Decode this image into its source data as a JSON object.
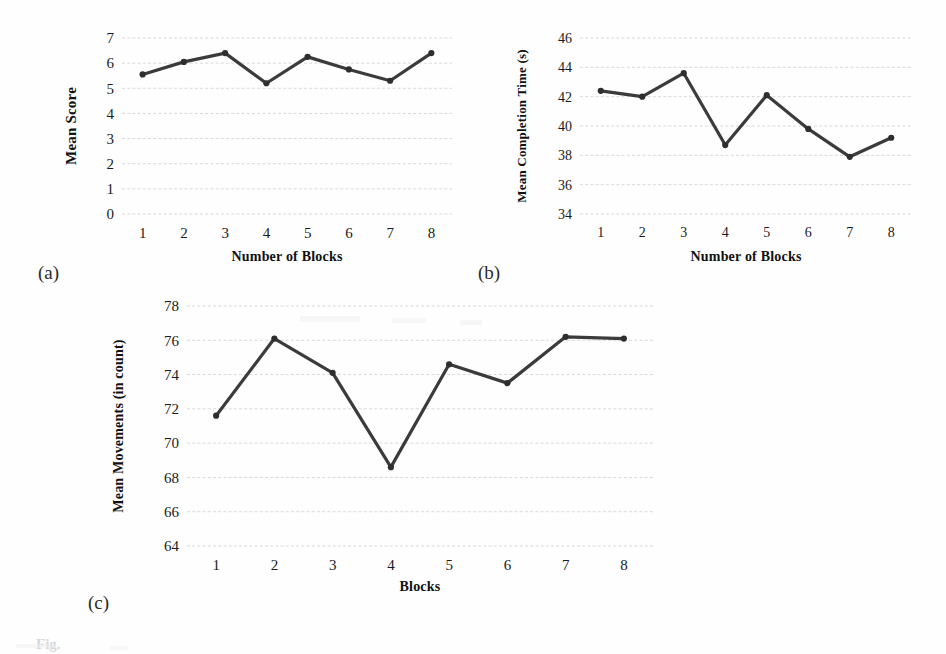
{
  "figure": {
    "subfigure_labels": [
      "(a)",
      "(b)",
      "(c)"
    ],
    "caption_fragment": "Fig."
  },
  "chart_data": [
    {
      "id": "a",
      "type": "line",
      "title": "",
      "xlabel": "Number of Blocks",
      "ylabel": "Mean Score",
      "categories": [
        "1",
        "2",
        "3",
        "4",
        "5",
        "6",
        "7",
        "8"
      ],
      "x": [
        1,
        2,
        3,
        4,
        5,
        6,
        7,
        8
      ],
      "values": [
        5.55,
        6.05,
        6.4,
        5.2,
        6.25,
        5.75,
        5.3,
        6.4
      ],
      "yticks": [
        0,
        1,
        2,
        3,
        4,
        5,
        6,
        7
      ],
      "ytick_labels": [
        "0",
        "1",
        "2",
        "3",
        "4",
        "5",
        "6",
        "7"
      ],
      "ylim": [
        0,
        7
      ],
      "grid": true,
      "legend": "none",
      "marker": "circle",
      "line_color": "#3b3b3b"
    },
    {
      "id": "b",
      "type": "line",
      "title": "",
      "xlabel": "Number of Blocks",
      "ylabel": "Mean Completion Time (s)",
      "categories": [
        "1",
        "2",
        "3",
        "4",
        "5",
        "6",
        "7",
        "8"
      ],
      "x": [
        1,
        2,
        3,
        4,
        5,
        6,
        7,
        8
      ],
      "values": [
        42.4,
        42.0,
        43.6,
        38.7,
        42.1,
        39.8,
        37.9,
        39.2
      ],
      "yticks": [
        34,
        36,
        38,
        40,
        42,
        44,
        46
      ],
      "ytick_labels": [
        "34",
        "36",
        "38",
        "40",
        "42",
        "44",
        "46"
      ],
      "ylim": [
        34,
        46
      ],
      "grid": true,
      "legend": "none",
      "marker": "circle",
      "line_color": "#3b3b3b"
    },
    {
      "id": "c",
      "type": "line",
      "title": "",
      "xlabel": "Blocks",
      "ylabel": "Mean Movements (in count)",
      "categories": [
        "1",
        "2",
        "3",
        "4",
        "5",
        "6",
        "7",
        "8"
      ],
      "x": [
        1,
        2,
        3,
        4,
        5,
        6,
        7,
        8
      ],
      "values": [
        71.6,
        76.1,
        74.1,
        68.6,
        74.6,
        73.5,
        76.2,
        76.1
      ],
      "yticks": [
        64,
        66,
        68,
        70,
        72,
        74,
        76,
        78
      ],
      "ytick_labels": [
        "64",
        "66",
        "68",
        "70",
        "72",
        "74",
        "76",
        "78"
      ],
      "ylim": [
        64,
        78
      ],
      "grid": true,
      "legend": "none",
      "marker": "circle",
      "line_color": "#3b3b3b"
    }
  ],
  "colors": {
    "line": "#3b3b3b",
    "marker": "#2e2e2e",
    "gridline": "#d8d8d8",
    "text": "#1b1b1b",
    "background": "#ffffff"
  }
}
